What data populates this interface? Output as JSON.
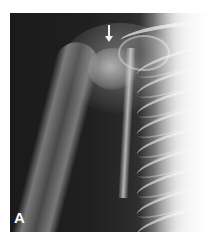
{
  "figure": {
    "panel_label": "A",
    "annotation": {
      "type": "arrow",
      "icon": "down-arrow-icon",
      "color": "#f2f2f2",
      "points_to": "proximal humerus"
    },
    "colors": {
      "background": "#ffffff",
      "film_dark": "#1c1c1c",
      "bone": "#d8d8d8"
    }
  }
}
